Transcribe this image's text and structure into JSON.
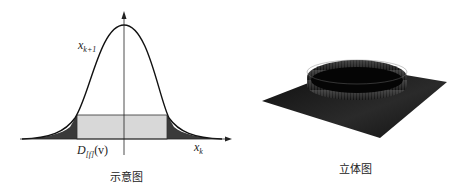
{
  "left_figure": {
    "caption": "示意图",
    "curve_label": "x",
    "curve_label_sub": "k+1",
    "x_axis_label": "x",
    "x_axis_label_sub": "k",
    "box_label": "D",
    "box_label_sub": "[f]",
    "box_label_arg": "(v)",
    "colors": {
      "curve": "#111111",
      "tail_fill": "#3a3a3a",
      "box_fill": "#d8d8d8",
      "box_stroke": "#333333"
    }
  },
  "right_figure": {
    "caption": "立体图",
    "colors": {
      "surface": "#1a1a1a",
      "highlight": "#8a8a8a"
    }
  }
}
